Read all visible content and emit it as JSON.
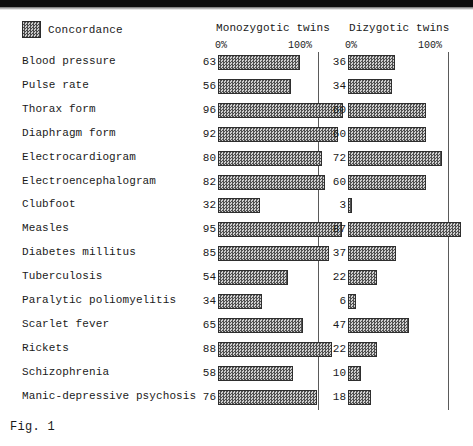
{
  "legend": {
    "swatch_name": "concordance-swatch",
    "label": "Concordance"
  },
  "columns": {
    "monozygotic": {
      "title": "Monozygotic twins",
      "axis_min_label": "0%",
      "axis_max_label": "100%"
    },
    "dizygotic": {
      "title": "Dizygotic twins",
      "axis_min_label": "0%",
      "axis_max_label": "100%"
    }
  },
  "caption": "Fig. 1",
  "colors": {
    "bar_fill": "#9a9a9a",
    "bar_border": "#2e2e2e",
    "rule": "#5a5a5a",
    "text": "#1a1a1a",
    "background": "#ffffff"
  },
  "chart_data": {
    "type": "bar",
    "title": "Fig. 1",
    "xlabel": "Concordance (%)",
    "ylabel": "",
    "xlim": [
      0,
      100
    ],
    "grid": false,
    "legend": [
      "Concordance"
    ],
    "legend_position": "top-left",
    "orientation": "horizontal",
    "categories": [
      "Blood pressure",
      "Pulse rate",
      "Thorax form",
      "Diaphragm form",
      "Electrocardiogram",
      "Electroencephalogram",
      "Clubfoot",
      "Measles",
      "Diabetes millitus",
      "Tuberculosis",
      "Paralytic poliomyelitis",
      "Scarlet fever",
      "Rickets",
      "Schizophrenia",
      "Manic-depressive psychosis"
    ],
    "series": [
      {
        "name": "Monozygotic twins",
        "values": [
          63,
          56,
          96,
          92,
          80,
          82,
          32,
          95,
          85,
          54,
          34,
          65,
          88,
          58,
          76
        ]
      },
      {
        "name": "Dizygotic twins",
        "values": [
          36,
          34,
          60,
          60,
          72,
          60,
          3,
          87,
          37,
          22,
          6,
          47,
          22,
          10,
          18
        ]
      }
    ]
  }
}
